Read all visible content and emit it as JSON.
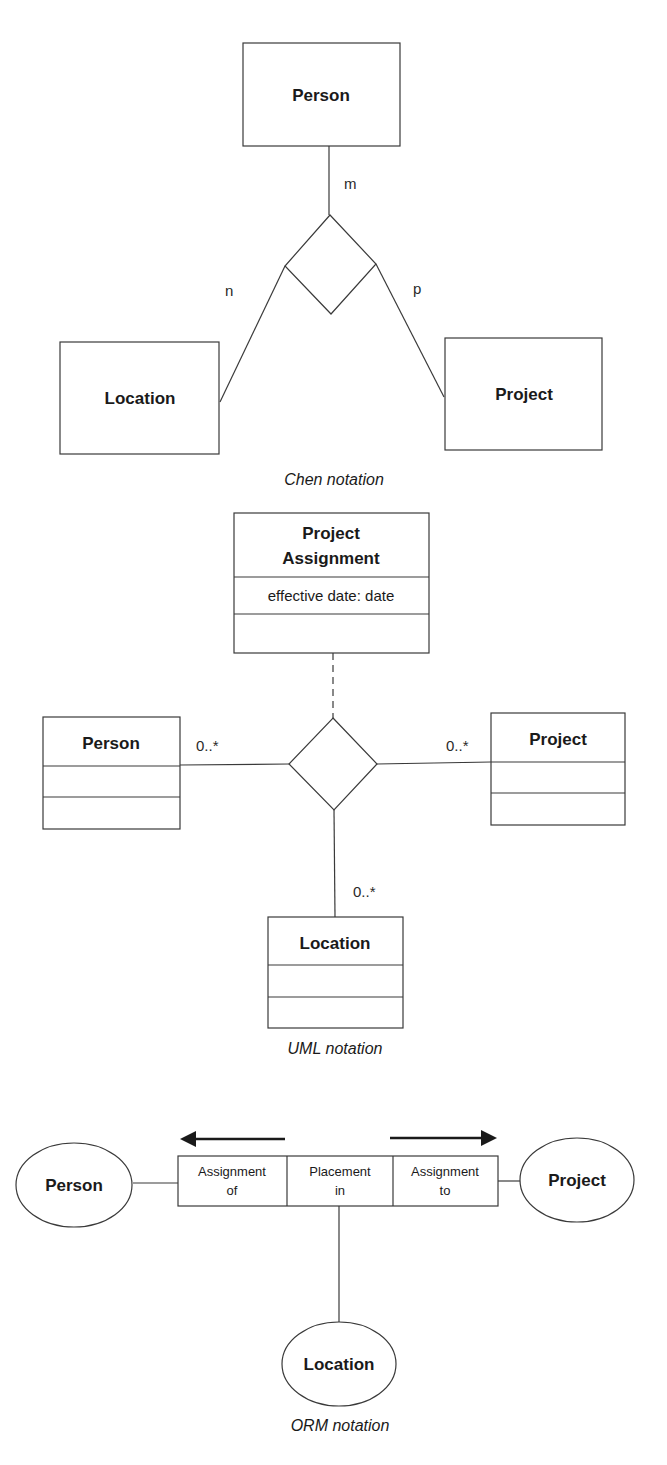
{
  "chen": {
    "entities": {
      "person": "Person",
      "location": "Location",
      "project": "Project"
    },
    "cardinalities": {
      "person": "m",
      "location": "n",
      "project": "p"
    },
    "caption": "Chen notation"
  },
  "uml": {
    "association_class": {
      "name_line1": "Project",
      "name_line2": "Assignment",
      "attribute": "effective date: date"
    },
    "classes": {
      "person": "Person",
      "project": "Project",
      "location": "Location"
    },
    "multiplicities": {
      "person": "0..*",
      "project": "0..*",
      "location": "0..*"
    },
    "caption": "UML notation"
  },
  "orm": {
    "entities": {
      "person": "Person",
      "project": "Project",
      "location": "Location"
    },
    "roles": [
      {
        "line1": "Assignment",
        "line2": "of"
      },
      {
        "line1": "Placement",
        "line2": "in"
      },
      {
        "line1": "Assignment",
        "line2": "to"
      }
    ],
    "caption": "ORM notation"
  },
  "colors": {
    "line": "#3a3a3a",
    "text": "#1a1a1a",
    "background": "#ffffff"
  }
}
